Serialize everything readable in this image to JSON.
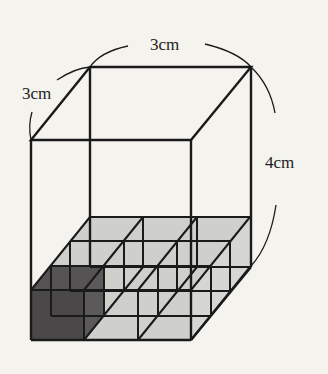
{
  "labels": {
    "top_width": "3cm",
    "depth": "3cm",
    "height": "4cm"
  },
  "colors": {
    "background": "#f4f3ee",
    "line": "#1a1a1a",
    "tray_fill": "#cfcfcb",
    "highlight_cube_fill": "#4a4848"
  },
  "figure": {
    "grid_columns": 3,
    "grid_rows": 3,
    "unit_cube_layers": 1,
    "highlighted_cube": "front-left"
  }
}
